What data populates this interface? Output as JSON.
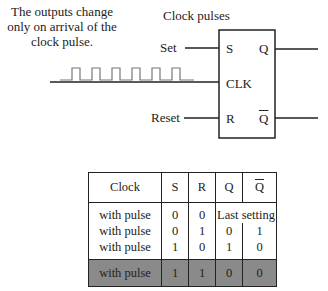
{
  "annotation": "The outputs change only on arrival of the clock pulse.",
  "clock_title": "Clock pulses",
  "inputs": {
    "set_label": "Set",
    "reset_label": "Reset"
  },
  "block": {
    "s": "S",
    "clk": "CLK",
    "r": "R",
    "q": "Q",
    "qbar": "Q"
  },
  "table": {
    "headers": [
      "Clock",
      "S",
      "R",
      "Q",
      "Q"
    ],
    "rows": [
      [
        "with pulse",
        "0",
        "0",
        "Last setting",
        ""
      ],
      [
        "with pulse",
        "0",
        "1",
        "0",
        "1"
      ],
      [
        "with pulse",
        "1",
        "0",
        "1",
        "0"
      ]
    ],
    "highlight_row": [
      "with pulse",
      "1",
      "1",
      "0",
      "0"
    ],
    "highlight_color": "#8a8a8a"
  }
}
